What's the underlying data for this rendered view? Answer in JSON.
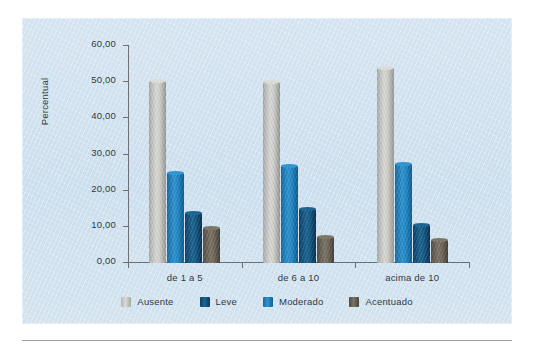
{
  "chart_data": {
    "type": "bar",
    "title": "",
    "subtitle": "",
    "xlabel": "",
    "ylabel": "Percentual",
    "categories": [
      "de 1 a 5",
      "de 6 a 10",
      "acima de 10"
    ],
    "series": [
      {
        "name": "Ausente",
        "color": "#cfcfcb",
        "values": [
          50.4,
          50.0,
          53.8
        ]
      },
      {
        "name": "Moderado",
        "color": "#2386c2",
        "values": [
          24.8,
          26.8,
          27.4
        ]
      },
      {
        "name": "Leve",
        "color": "#15567f",
        "values": [
          13.8,
          14.9,
          10.6
        ]
      },
      {
        "name": "Acentuado",
        "color": "#6e6659",
        "values": [
          9.8,
          7.2,
          6.4
        ]
      }
    ],
    "bar_order": [
      "Ausente",
      "Moderado",
      "Leve",
      "Acentuado"
    ],
    "legend_order": [
      "Ausente",
      "Leve",
      "Moderado",
      "Acentuado"
    ],
    "yticks": [
      "0,00",
      "10,00",
      "20,00",
      "30,00",
      "40,00",
      "50,00",
      "60,00"
    ],
    "ytick_values": [
      0,
      10,
      20,
      30,
      40,
      50,
      60
    ],
    "ylim": [
      0,
      60
    ],
    "grid": false,
    "legend_position": "bottom",
    "decimal_separator": ",",
    "panel_background": "#cfe0ee"
  },
  "figure": {
    "panel_background": "#cfe0ee",
    "axis_color": "#6d6f73",
    "text_color": "#2f3a44",
    "rule_color": "#9aa0a6"
  },
  "legend": {
    "items": [
      {
        "label": "Ausente",
        "swatch": "ausente"
      },
      {
        "label": "Leve",
        "swatch": "leve"
      },
      {
        "label": "Moderado",
        "swatch": "moderado"
      },
      {
        "label": "Acentuado",
        "swatch": "acentuado"
      }
    ]
  }
}
